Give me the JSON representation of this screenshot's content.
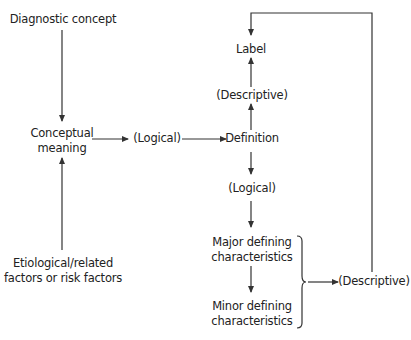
{
  "diagram": {
    "nodes": {
      "diagnostic_concept": "Diagnostic concept",
      "conceptual_meaning_1": "Conceptual",
      "conceptual_meaning_2": "meaning",
      "logical_1": "(Logical)",
      "definition": "Definition",
      "descriptive_1": "(Descriptive)",
      "label": "Label",
      "logical_2": "(Logical)",
      "major_1": "Major defining",
      "major_2": "characteristics",
      "minor_1": "Minor defining",
      "minor_2": "characteristics",
      "descriptive_2": "(Descriptive)",
      "etiological_1": "Etiological/related",
      "etiological_2": "factors or risk factors"
    },
    "edges": [
      {
        "from": "Diagnostic concept",
        "to": "Conceptual meaning"
      },
      {
        "from": "Etiological/related factors or risk factors",
        "to": "Conceptual meaning"
      },
      {
        "from": "Conceptual meaning",
        "to": "(Logical)"
      },
      {
        "from": "(Logical)",
        "to": "Definition"
      },
      {
        "from": "Definition",
        "to": "(Descriptive)"
      },
      {
        "from": "(Descriptive)",
        "to": "Label"
      },
      {
        "from": "Definition",
        "to": "(Logical)"
      },
      {
        "from": "(Logical)",
        "to": "Major defining characteristics"
      },
      {
        "from": "Major defining characteristics",
        "to": "Minor defining characteristics"
      },
      {
        "from": "Major & Minor defining characteristics",
        "to": "(Descriptive)"
      },
      {
        "from": "(Descriptive)",
        "to": "Label"
      }
    ],
    "colors": {
      "line": "#333333",
      "text": "#222222",
      "background": "#ffffff"
    }
  }
}
